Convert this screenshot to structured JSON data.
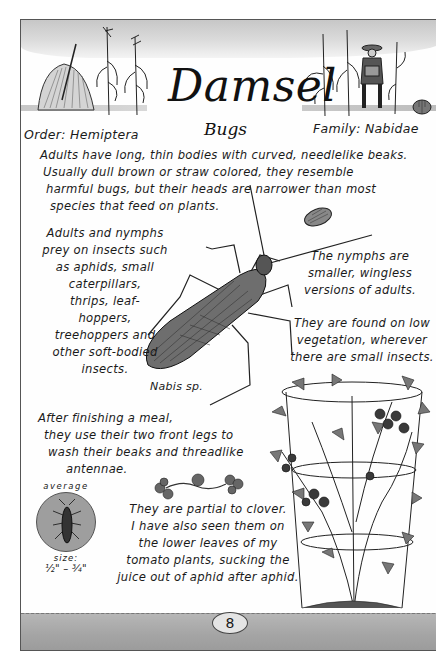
{
  "header": {
    "title": "Damsel",
    "subtitle": "Bugs",
    "order": "Order: Hemiptera",
    "family": "Family: Nabidae"
  },
  "body": {
    "intro": [
      "Adults have long, thin bodies with curved, needlelike beaks.",
      "Usually dull brown or straw colored, they resemble",
      "harmful bugs, but their heads are narrower than most",
      "species that feed on plants."
    ],
    "prey": [
      "Adults and nymphs",
      "prey on insects such",
      "as aphids, small",
      "caterpillars,",
      "thrips, leaf-",
      "hoppers,",
      "treehoppers and",
      "other soft-bodied",
      "insects."
    ],
    "nymphs": [
      "The nymphs are",
      "smaller, wingless",
      "versions of adults."
    ],
    "habitat": [
      "They are found on low",
      "vegetation, wherever",
      "there are small insects."
    ],
    "meal": [
      "After finishing a meal,",
      "they use their two front legs to",
      "wash their beaks and threadlike",
      "antennae."
    ],
    "clover": [
      "They are partial to clover.",
      "I have also seen them on",
      "the lower leaves of my",
      "tomato plants, sucking the",
      "juice out of aphid after aphid."
    ]
  },
  "illustration": {
    "caption": "Nabis sp.",
    "icons": [
      "haystack-icon",
      "corn-stalk-icon",
      "gardener-icon",
      "pumpkin-icon",
      "damsel-bug-icon",
      "nymph-icon",
      "clover-icon",
      "tomato-plant-icon"
    ]
  },
  "size_badge": {
    "label_top": "average",
    "label_bottom": "size:",
    "value": "½\" – ¾\""
  },
  "footer": {
    "page_number": "8"
  },
  "colors": {
    "ink": "#1a1a1a",
    "wash_gray": "#bdbdbd",
    "ground_gray": "#a4a4a4",
    "paper": "#fefefe"
  }
}
